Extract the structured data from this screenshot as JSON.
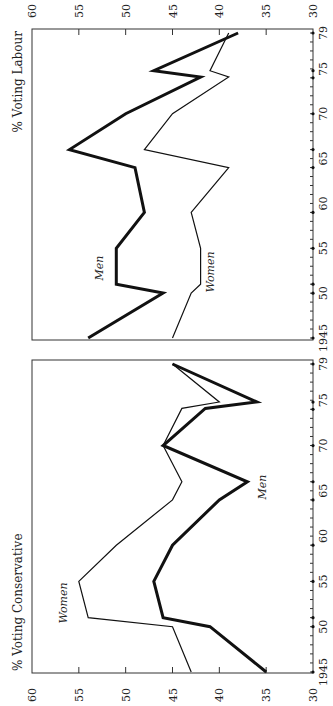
{
  "figure": {
    "orientation": "rotated-90-ccw"
  },
  "chart_data": [
    {
      "type": "line",
      "title": "% Voting Labour",
      "xlabel": "",
      "ylabel": "% Voting Labour",
      "ylim": [
        30,
        60
      ],
      "yticks": [
        "60",
        "55",
        "50",
        "45",
        "40",
        "35",
        "30"
      ],
      "xticks": [
        "1945",
        "50",
        "55",
        "60",
        "65",
        "70",
        "75",
        "79"
      ],
      "x": [
        1945,
        1950,
        1951,
        1955,
        1959,
        1964,
        1966,
        1970,
        1974.1,
        1974.8,
        1979
      ],
      "series": [
        {
          "name": "Men",
          "values": [
            54,
            46,
            51,
            51,
            48,
            49,
            56,
            50,
            42,
            47,
            38
          ]
        },
        {
          "name": "Women",
          "values": [
            45,
            43,
            42,
            42,
            43,
            39,
            48,
            45,
            39,
            41,
            39
          ]
        }
      ],
      "series_labels": {
        "men": "Men",
        "women": "Women"
      },
      "grid": false,
      "legend": "inline labels"
    },
    {
      "type": "line",
      "title": "% Voting Conservative",
      "xlabel": "",
      "ylabel": "% Voting Conservative",
      "ylim": [
        30,
        60
      ],
      "yticks": [
        "60",
        "55",
        "50",
        "45",
        "40",
        "35",
        "30"
      ],
      "xticks": [
        "1945",
        "50",
        "55",
        "60",
        "65",
        "70",
        "75",
        "79"
      ],
      "x": [
        1945,
        1950,
        1951,
        1955,
        1959,
        1964,
        1966,
        1970,
        1974.1,
        1974.8,
        1979
      ],
      "series": [
        {
          "name": "Men",
          "values": [
            35,
            41,
            46,
            47,
            45,
            40,
            37,
            46,
            41.5,
            36,
            45
          ]
        },
        {
          "name": "Women",
          "values": [
            43,
            45,
            54,
            55,
            51,
            45,
            44,
            46,
            44,
            40,
            45
          ]
        }
      ],
      "series_labels": {
        "men": "Men",
        "women": "Women"
      },
      "grid": false,
      "legend": "inline labels"
    }
  ],
  "election_years": [
    1945,
    1950,
    1951,
    1955,
    1959,
    1964,
    1966,
    1970,
    1974,
    1974.8,
    1979
  ]
}
